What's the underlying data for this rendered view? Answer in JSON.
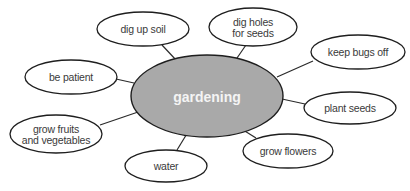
{
  "diagram": {
    "type": "concept-map",
    "colors": {
      "center_fill": "#a9a9a9",
      "node_fill": "#ffffff",
      "stroke": "#1e1e1e",
      "center_text": "#f4f4f4",
      "node_text": "#3a3a3a"
    },
    "center": {
      "label": "gardening",
      "cx": 207,
      "cy": 96,
      "rx": 76,
      "ry": 41
    },
    "nodes": [
      {
        "id": "dig-up-soil",
        "lines": [
          "dig up soil"
        ],
        "cx": 143,
        "cy": 29,
        "rx": 46,
        "ry": 17,
        "lx1": 162,
        "ly1": 45,
        "lx2": 176,
        "ly2": 60
      },
      {
        "id": "dig-holes-for-seeds",
        "lines": [
          "dig holes",
          "for seeds"
        ],
        "cx": 253,
        "cy": 27,
        "rx": 44,
        "ry": 19,
        "lx1": 246,
        "ly1": 45,
        "lx2": 237,
        "ly2": 58
      },
      {
        "id": "keep-bugs-off",
        "lines": [
          "keep bugs off"
        ],
        "cx": 358,
        "cy": 52,
        "rx": 47,
        "ry": 17,
        "lx1": 313,
        "ly1": 61,
        "lx2": 277,
        "ly2": 77
      },
      {
        "id": "be-patient",
        "lines": [
          "be patient"
        ],
        "cx": 71,
        "cy": 77,
        "rx": 46,
        "ry": 17,
        "lx1": 116,
        "ly1": 79,
        "lx2": 134,
        "ly2": 83
      },
      {
        "id": "plant-seeds",
        "lines": [
          "plant seeds"
        ],
        "cx": 350,
        "cy": 108,
        "rx": 46,
        "ry": 16,
        "lx1": 305,
        "ly1": 104,
        "lx2": 282,
        "ly2": 99
      },
      {
        "id": "grow-fruits-and-vegetables",
        "lines": [
          "grow fruits",
          "and vegetables"
        ],
        "cx": 56,
        "cy": 134,
        "rx": 46,
        "ry": 19,
        "lx1": 100,
        "ly1": 125,
        "lx2": 141,
        "ly2": 111
      },
      {
        "id": "water",
        "lines": [
          "water"
        ],
        "cx": 166,
        "cy": 166,
        "rx": 41,
        "ry": 16,
        "lx1": 177,
        "ly1": 150,
        "lx2": 188,
        "ly2": 132
      },
      {
        "id": "grow-flowers",
        "lines": [
          "grow flowers"
        ],
        "cx": 288,
        "cy": 151,
        "rx": 45,
        "ry": 17,
        "lx1": 256,
        "ly1": 138,
        "lx2": 240,
        "ly2": 128
      }
    ]
  }
}
